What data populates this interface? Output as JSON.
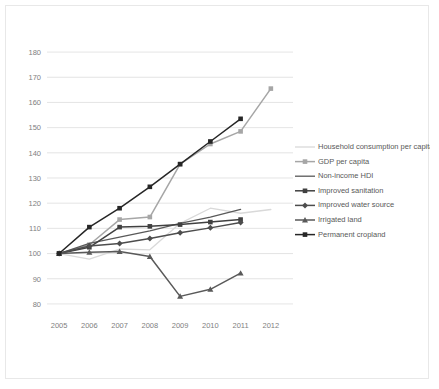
{
  "chart_data": {
    "type": "line",
    "title": "",
    "xlabel": "",
    "ylabel": "",
    "x": [
      2005,
      2006,
      2007,
      2008,
      2009,
      2010,
      2011,
      2012
    ],
    "xtick_labels": [
      "2005",
      "2006",
      "2007",
      "2008",
      "2009",
      "2010",
      "2011",
      "2012"
    ],
    "ytick_labels": [
      "80",
      "90",
      "100",
      "110",
      "120",
      "130",
      "140",
      "150",
      "160",
      "170",
      "180"
    ],
    "ylim": [
      76,
      184
    ],
    "xlim": [
      2004.6,
      2012.6
    ],
    "grid": "horizontal",
    "legend_position": "right",
    "series": [
      {
        "name": "Household consumption per capita",
        "color": "#d9d9d9",
        "marker": "none",
        "values": [
          100,
          97.8,
          101.8,
          101.5,
          112.0,
          118.0,
          116.0,
          117.5
        ]
      },
      {
        "name": "GDP per capita",
        "color": "#a6a6a6",
        "marker": "square",
        "values": [
          100,
          103.5,
          113.5,
          114.5,
          135.5,
          143.5,
          148.5,
          165.5
        ]
      },
      {
        "name": "Non-income HDI",
        "color": "#595959",
        "marker": "none",
        "values": [
          100,
          104.0,
          106.5,
          109.0,
          112.0,
          114.5,
          117.5,
          null
        ]
      },
      {
        "name": "Improved sanitation",
        "color": "#404040",
        "marker": "square",
        "values": [
          100,
          102.5,
          110.5,
          110.8,
          111.5,
          112.5,
          113.5,
          null
        ]
      },
      {
        "name": "Improved water source",
        "color": "#4d4d4d",
        "marker": "diamond",
        "values": [
          100,
          103.0,
          104.0,
          106.0,
          108.3,
          110.2,
          112.3,
          null
        ]
      },
      {
        "name": "Irrigated land",
        "color": "#595959",
        "marker": "triangle",
        "values": [
          100,
          100.5,
          100.8,
          98.8,
          83.0,
          85.8,
          92.2,
          null
        ]
      },
      {
        "name": "Permanent cropland",
        "color": "#262626",
        "marker": "square",
        "values": [
          100,
          110.5,
          118.0,
          126.5,
          135.5,
          144.5,
          153.5,
          null
        ]
      }
    ]
  }
}
